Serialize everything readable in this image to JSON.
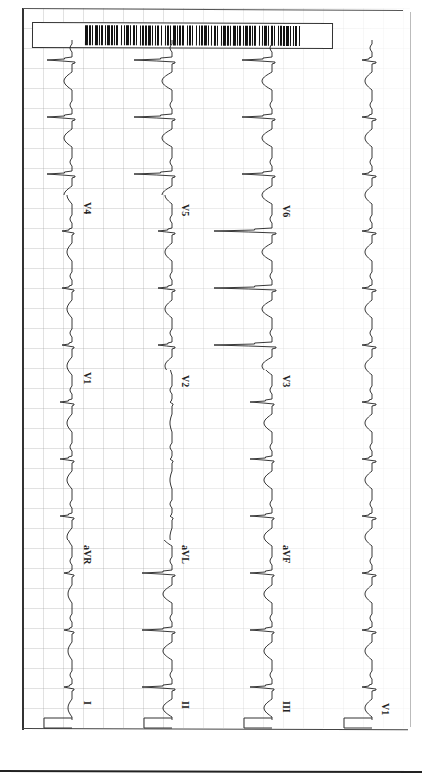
{
  "document": {
    "type": "12-lead ECG printout (rotated 90°)",
    "page_number": "",
    "barcode": {
      "present": true
    }
  },
  "rows": [
    {
      "id": "row1",
      "segments": [
        "I",
        "aVR",
        "V1",
        "V4"
      ]
    },
    {
      "id": "row2",
      "segments": [
        "II",
        "aVL",
        "V2",
        "V5"
      ]
    },
    {
      "id": "row3",
      "segments": [
        "III",
        "aVF",
        "V3",
        "V6"
      ]
    },
    {
      "id": "row4",
      "segments": [
        "V1"
      ]
    }
  ],
  "labels": {
    "row1": {
      "seg1": "I",
      "seg2": "aVR",
      "seg3": "V1",
      "seg4": "V4"
    },
    "row2": {
      "seg1": "II",
      "seg2": "aVL",
      "seg3": "V2",
      "seg4": "V5"
    },
    "row3": {
      "seg1": "III",
      "seg2": "aVF",
      "seg3": "V3",
      "seg4": "V6"
    },
    "row4": {
      "seg1": "V1"
    }
  },
  "colors": {
    "trace": "#222222",
    "grid": "#c8c8c8",
    "paper": "#ffffff",
    "barcode": "#111111"
  }
}
